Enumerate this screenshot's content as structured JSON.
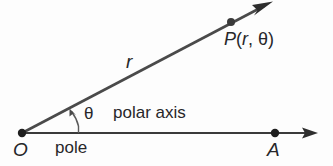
{
  "figure": {
    "background_color": "#fdfdfd",
    "stroke_color": "#3a3a3a",
    "text_color": "#27272a"
  },
  "labels": {
    "origin": "O",
    "axis_point": "A",
    "radius": "r",
    "angle": "θ",
    "pole": "pole",
    "polar_axis": "polar axis",
    "point_P_name": "P",
    "point_P_open_paren": "(",
    "point_P_r": "r",
    "point_P_comma": ",",
    "point_P_theta": "θ",
    "point_P_close_paren": ")",
    "point_P_full": "P(r, θ)"
  },
  "geometry": {
    "origin": {
      "x": 22,
      "y": 133
    },
    "point_P": {
      "x": 231,
      "y": 22
    },
    "ray_tip": {
      "x": 272,
      "y": 2
    },
    "axis_point_A": {
      "x": 275,
      "y": 133
    },
    "axis_tip": {
      "x": 318,
      "y": 133
    },
    "angle_degrees": 28,
    "arc_radius": 56
  }
}
